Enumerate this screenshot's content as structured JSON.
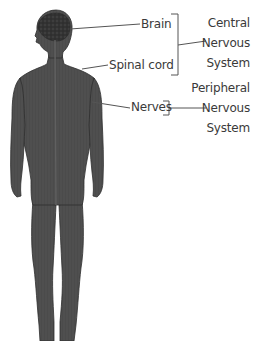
{
  "diagram": {
    "type": "anatomical-labeled-figure",
    "colors": {
      "body": "#4a4a4a",
      "body_outline": "#2e2e2e",
      "brain": "#353535",
      "leader_line": "#555555",
      "text": "#3a3a3a",
      "background": "#ffffff"
    },
    "labels": {
      "brain": "Brain",
      "spinal_cord": "Spinal cord",
      "nerves": "Nerves"
    },
    "groups": [
      {
        "id": "cns",
        "lines": [
          "Central",
          "Nervous",
          "System"
        ],
        "members": [
          "Brain",
          "Spinal cord"
        ]
      },
      {
        "id": "pns",
        "lines": [
          "Peripheral",
          "Nervous",
          "System"
        ],
        "members": [
          "Nerves"
        ]
      }
    ]
  }
}
